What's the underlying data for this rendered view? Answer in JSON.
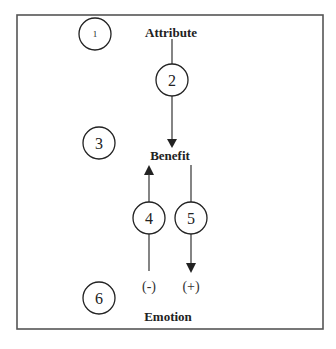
{
  "diagram": {
    "nodes": {
      "attribute": "Attribute",
      "benefit": "Benefit",
      "emotion": "Emotion"
    },
    "circles": [
      {
        "id": "1",
        "label": "1"
      },
      {
        "id": "2",
        "label": "2"
      },
      {
        "id": "3",
        "label": "3"
      },
      {
        "id": "4",
        "label": "4"
      },
      {
        "id": "5",
        "label": "5"
      },
      {
        "id": "6",
        "label": "6"
      }
    ],
    "signs": {
      "negative": "(-)",
      "positive": "(+)"
    },
    "edges": [
      {
        "from": "Attribute",
        "to": "Benefit",
        "via": "2",
        "direction": "down"
      },
      {
        "from": "Emotion",
        "to": "Benefit",
        "via": "4",
        "direction": "up",
        "sign": "(-)"
      },
      {
        "from": "Benefit",
        "to": "Emotion",
        "via": "5",
        "direction": "down",
        "sign": "(+)"
      }
    ]
  }
}
